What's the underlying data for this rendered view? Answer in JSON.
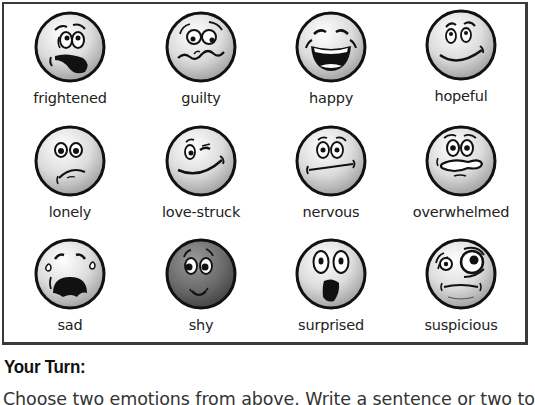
{
  "emotions": [
    {
      "label": "frightened",
      "icon": "frightened-face-icon"
    },
    {
      "label": "guilty",
      "icon": "guilty-face-icon"
    },
    {
      "label": "happy",
      "icon": "happy-face-icon"
    },
    {
      "label": "hopeful",
      "icon": "hopeful-face-icon"
    },
    {
      "label": "lonely",
      "icon": "lonely-face-icon"
    },
    {
      "label": "love-struck",
      "icon": "love-struck-face-icon"
    },
    {
      "label": "nervous",
      "icon": "nervous-face-icon"
    },
    {
      "label": "overwhelmed",
      "icon": "overwhelmed-face-icon"
    },
    {
      "label": "sad",
      "icon": "sad-face-icon"
    },
    {
      "label": "shy",
      "icon": "shy-face-icon"
    },
    {
      "label": "surprised",
      "icon": "surprised-face-icon"
    },
    {
      "label": "suspicious",
      "icon": "suspicious-face-icon"
    }
  ],
  "your_turn": {
    "heading": "Your Turn:",
    "instruction": "Choose two emotions from above. Write a sentence or two to"
  },
  "colors": {
    "border": "#3a3a3a",
    "face_light": "#f2f2f2",
    "face_mid": "#a8a8a8",
    "face_shy_dark": "#555555",
    "ink": "#111111"
  }
}
